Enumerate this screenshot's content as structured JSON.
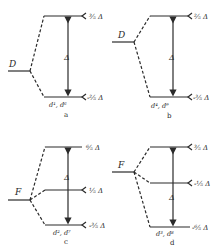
{
  "figure": {
    "panels": [
      {
        "id": "a",
        "caption": "a",
        "term": "D",
        "config": "d¹, d⁶",
        "gap": "Δ",
        "levels": [
          "³⁄₅ Δ",
          "-²⁄₅ Δ"
        ]
      },
      {
        "id": "b",
        "caption": "b",
        "term": "D",
        "config": "d⁴, d⁹",
        "gap": "Δ",
        "levels": [
          "²⁄₅ Δ",
          "-³⁄₅ Δ"
        ]
      },
      {
        "id": "c",
        "caption": "c",
        "term": "F",
        "config": "d², d⁷",
        "gap": "Δ",
        "levels": [
          "⁶⁄₅ Δ",
          "¹⁄₅ Δ",
          "-³⁄₅ Δ"
        ]
      },
      {
        "id": "d",
        "caption": "d",
        "term": "F",
        "config": "d³, d⁸",
        "gap": "Δ",
        "levels": [
          "³⁄₅ Δ",
          "-¹⁄₅ Δ",
          "-⁶⁄₅ Δ"
        ]
      }
    ],
    "colors": {
      "ink": "#2a2a2a",
      "background": "#ffffff"
    }
  }
}
